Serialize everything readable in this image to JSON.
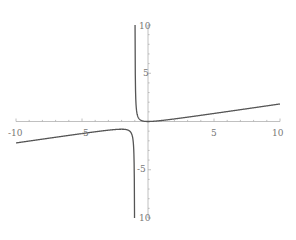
{
  "chart_data": {
    "type": "line",
    "title": "",
    "xlabel": "",
    "ylabel": "",
    "xlim": [
      -10,
      10
    ],
    "ylim": [
      -10,
      10
    ],
    "grid": false,
    "legend": null,
    "function": "y = x^2 / (5 (x + 1))",
    "vertical_asymptote": -1,
    "x_ticks": [
      -10,
      -5,
      5,
      10
    ],
    "y_ticks": [
      10,
      5,
      -5,
      -10
    ],
    "x_tick_labels": [
      "-10",
      "-5",
      "5",
      "10"
    ],
    "y_tick_labels": [
      "10",
      "5",
      "-5",
      "10"
    ],
    "series": [
      {
        "name": "left branch",
        "x": [
          -10,
          -8,
          -6,
          -4,
          -3,
          -2,
          -1.5,
          -1.3,
          -1.2,
          -1.1,
          -1.05
        ],
        "y": [
          -2.22,
          -1.83,
          -1.44,
          -1.07,
          -0.9,
          -0.8,
          -0.9,
          -1.13,
          -1.44,
          -2.42,
          -4.41
        ]
      },
      {
        "name": "right branch",
        "x": [
          -0.95,
          -0.9,
          -0.8,
          -0.6,
          -0.3,
          0,
          1,
          2,
          4,
          6,
          8,
          10
        ],
        "y": [
          3.61,
          1.62,
          0.64,
          0.18,
          0.03,
          0,
          0.1,
          0.27,
          0.64,
          1.03,
          1.42,
          1.82
        ]
      }
    ],
    "colors": {
      "curve": "#555555",
      "axis": "#b0b0b0",
      "tick_label": "#777777"
    }
  }
}
